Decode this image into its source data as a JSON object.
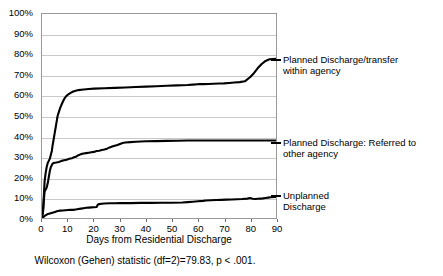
{
  "chart_data": {
    "type": "line",
    "title": "",
    "xlabel": "Days from Residential Discharge",
    "ylabel": "",
    "xlim": [
      0,
      90
    ],
    "ylim": [
      0,
      100
    ],
    "grid": true,
    "legend_position": "right",
    "x_ticks": [
      "0",
      "10",
      "20",
      "30",
      "40",
      "50",
      "60",
      "70",
      "80",
      "90"
    ],
    "y_ticks": [
      "0%",
      "10%",
      "20%",
      "30%",
      "40%",
      "50%",
      "60%",
      "70%",
      "80%",
      "90%",
      "100%"
    ],
    "annotation": "Wilcoxon (Gehen) statistic (df=2)=79.83, p < .001.",
    "series": [
      {
        "name": "Planned Discharge/transfer within agency",
        "color": "#000000",
        "points": [
          [
            0,
            0
          ],
          [
            0.4,
            4
          ],
          [
            0.8,
            13
          ],
          [
            1,
            18
          ],
          [
            1.4,
            22
          ],
          [
            1.8,
            25
          ],
          [
            2.2,
            27
          ],
          [
            2.6,
            28
          ],
          [
            3,
            29
          ],
          [
            3.4,
            31
          ],
          [
            3.8,
            33
          ],
          [
            4,
            35
          ],
          [
            4.4,
            38
          ],
          [
            4.8,
            41
          ],
          [
            5.2,
            44
          ],
          [
            5.6,
            47
          ],
          [
            6,
            50
          ],
          [
            6.5,
            52
          ],
          [
            7,
            54
          ],
          [
            7.5,
            55.5
          ],
          [
            8,
            57
          ],
          [
            8.6,
            58.5
          ],
          [
            9.2,
            59.5
          ],
          [
            10,
            60.5
          ],
          [
            11,
            61.3
          ],
          [
            12,
            62
          ],
          [
            13,
            62.4
          ],
          [
            14,
            62.7
          ],
          [
            16,
            63
          ],
          [
            18,
            63.2
          ],
          [
            20,
            63.4
          ],
          [
            24,
            63.6
          ],
          [
            28,
            63.8
          ],
          [
            32,
            64
          ],
          [
            36,
            64.2
          ],
          [
            40,
            64.4
          ],
          [
            44,
            64.6
          ],
          [
            48,
            64.8
          ],
          [
            52,
            65
          ],
          [
            56,
            65.2
          ],
          [
            58,
            65.4
          ],
          [
            60,
            65.6
          ],
          [
            62,
            65.6
          ],
          [
            64,
            65.7
          ],
          [
            66,
            65.8
          ],
          [
            68,
            65.9
          ],
          [
            70,
            66
          ],
          [
            72,
            66.2
          ],
          [
            74,
            66.4
          ],
          [
            76,
            66.6
          ],
          [
            78,
            67
          ],
          [
            80,
            69
          ],
          [
            81.5,
            71
          ],
          [
            83,
            73.5
          ],
          [
            84.5,
            75.5
          ],
          [
            86,
            77
          ],
          [
            87.5,
            77.8
          ],
          [
            90,
            78
          ]
        ]
      },
      {
        "name": "Planned Discharge: Referred to other agency",
        "color": "#000000",
        "points": [
          [
            0,
            0
          ],
          [
            0.4,
            3
          ],
          [
            0.8,
            10
          ],
          [
            1,
            13
          ],
          [
            1.4,
            14
          ],
          [
            1.8,
            15
          ],
          [
            2.2,
            17
          ],
          [
            2.6,
            20
          ],
          [
            3,
            23
          ],
          [
            3.4,
            25
          ],
          [
            3.8,
            26
          ],
          [
            4,
            26.5
          ],
          [
            4.5,
            27
          ],
          [
            5.5,
            27.2
          ],
          [
            6.5,
            27.5
          ],
          [
            7.5,
            28
          ],
          [
            8.5,
            28.3
          ],
          [
            9.5,
            28.6
          ],
          [
            10.5,
            29
          ],
          [
            11.5,
            29.3
          ],
          [
            12,
            29.6
          ],
          [
            13,
            30
          ],
          [
            14,
            30.8
          ],
          [
            15,
            31.3
          ],
          [
            16,
            31.6
          ],
          [
            17,
            31.8
          ],
          [
            18,
            32
          ],
          [
            19,
            32.2
          ],
          [
            20,
            32.4
          ],
          [
            21,
            32.8
          ],
          [
            22,
            33
          ],
          [
            23,
            33.3
          ],
          [
            24,
            33.6
          ],
          [
            25,
            34
          ],
          [
            26,
            34.6
          ],
          [
            27,
            35
          ],
          [
            28,
            35.4
          ],
          [
            29,
            35.8
          ],
          [
            30,
            36.3
          ],
          [
            31,
            36.8
          ],
          [
            32,
            37
          ],
          [
            34,
            37.2
          ],
          [
            36,
            37.4
          ],
          [
            38,
            37.5
          ],
          [
            40,
            37.6
          ],
          [
            44,
            37.7
          ],
          [
            48,
            37.8
          ],
          [
            52,
            37.9
          ],
          [
            56,
            38
          ],
          [
            60,
            38
          ],
          [
            64,
            38
          ],
          [
            68,
            38
          ],
          [
            72,
            38
          ],
          [
            76,
            38
          ],
          [
            80,
            38
          ],
          [
            84,
            38
          ],
          [
            90,
            38
          ]
        ]
      },
      {
        "name": "Unplanned Discharge",
        "color": "#000000",
        "points": [
          [
            0,
            0
          ],
          [
            0.6,
            0.5
          ],
          [
            1.2,
            1.2
          ],
          [
            2,
            1.8
          ],
          [
            3,
            2.2
          ],
          [
            4,
            2.6
          ],
          [
            5,
            3
          ],
          [
            6,
            3.4
          ],
          [
            7,
            3.6
          ],
          [
            8,
            3.7
          ],
          [
            9,
            3.8
          ],
          [
            10,
            3.9
          ],
          [
            11,
            4
          ],
          [
            12,
            4
          ],
          [
            13,
            4.2
          ],
          [
            14,
            4.4
          ],
          [
            15,
            4.6
          ],
          [
            16,
            4.8
          ],
          [
            17,
            5
          ],
          [
            18,
            5.1
          ],
          [
            19,
            5.2
          ],
          [
            20,
            5.3
          ],
          [
            21,
            5.4
          ],
          [
            21.5,
            6.6
          ],
          [
            22,
            6.8
          ],
          [
            23,
            7
          ],
          [
            24,
            7.1
          ],
          [
            26,
            7.2
          ],
          [
            28,
            7.2
          ],
          [
            30,
            7.3
          ],
          [
            34,
            7.3
          ],
          [
            38,
            7.4
          ],
          [
            42,
            7.4
          ],
          [
            46,
            7.5
          ],
          [
            50,
            7.5
          ],
          [
            54,
            7.6
          ],
          [
            56,
            7.8
          ],
          [
            58,
            8
          ],
          [
            60,
            8.2
          ],
          [
            62,
            8.4
          ],
          [
            63,
            8.6
          ],
          [
            65,
            8.7
          ],
          [
            67,
            8.8
          ],
          [
            69,
            8.9
          ],
          [
            71,
            9
          ],
          [
            73,
            9.1
          ],
          [
            75,
            9.2
          ],
          [
            77,
            9.3
          ],
          [
            79,
            9.5
          ],
          [
            80,
            9.8
          ],
          [
            81,
            9.4
          ],
          [
            82,
            9.3
          ],
          [
            83,
            9.4
          ],
          [
            84,
            9.5
          ],
          [
            85,
            9.6
          ],
          [
            86,
            9.8
          ],
          [
            87,
            10
          ],
          [
            88,
            10.2
          ],
          [
            90,
            10.3
          ]
        ]
      }
    ]
  },
  "legend": [
    {
      "line1": "Planned Discharge/transfer",
      "line2": "within agency"
    },
    {
      "line1": "Planned Discharge: Referred to",
      "line2": "other agency"
    },
    {
      "line1": "Unplanned",
      "line2": "Discharge"
    }
  ]
}
